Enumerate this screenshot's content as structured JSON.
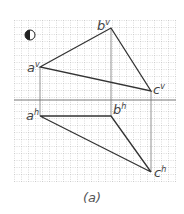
{
  "figure": {
    "caption": "(a)",
    "labels": {
      "a_v": "a",
      "a_v_sup": "v",
      "b_v": "b",
      "b_v_sup": "v",
      "c_v": "c",
      "c_v_sup": "v",
      "a_h": "a",
      "a_h_sup": "h",
      "b_h": "b",
      "b_h_sup": "h",
      "c_h": "c",
      "c_h_sup": "h"
    },
    "colors": {
      "line": "#333333",
      "grid": "#9a9a9a",
      "axis": "#777777"
    }
  }
}
